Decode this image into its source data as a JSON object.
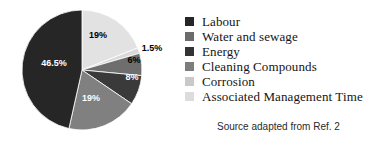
{
  "chart_data": {
    "type": "pie",
    "title": "",
    "subtitle": "",
    "xlabel": "",
    "ylabel": "",
    "grid": false,
    "legend_position": "right",
    "start_angle_deg": 0,
    "direction": "clockwise",
    "center": {
      "x": 82,
      "y": 70
    },
    "radius": 60,
    "total": 100,
    "categories": [
      "Labour",
      "Water and sewage",
      "Energy",
      "Cleaning Compounds",
      "Corrosion",
      "Associated Management Time"
    ],
    "values": [
      46.5,
      19,
      8,
      6,
      1.5,
      19
    ],
    "colors": [
      "#262626",
      "#808080",
      "#3a3a3a",
      "#6e6e6e",
      "#d9d9d9",
      "#e2e2e2"
    ],
    "slices": [
      {
        "label": "Associated Management Time",
        "value": 19,
        "display": "19%",
        "color": "#e2e2e2",
        "label_color": "#000000",
        "label_x": 98,
        "label_y": 38
      },
      {
        "label": "Corrosion",
        "value": 1.5,
        "display": "1.5%",
        "color": "#d9d9d9",
        "label_color": "#000000",
        "label_x": 152,
        "label_y": 51,
        "label_outside": true
      },
      {
        "label": "Cleaning Compounds",
        "value": 6,
        "display": "6%",
        "color": "#6e6e6e",
        "label_color": "#000000",
        "label_x": 134,
        "label_y": 63
      },
      {
        "label": "Energy",
        "value": 8,
        "display": "8%",
        "color": "#3a3a3a",
        "label_color": "#ffffff",
        "label_x": 132,
        "label_y": 80
      },
      {
        "label": "Water and sewage",
        "value": 19,
        "display": "19%",
        "color": "#808080",
        "label_color": "#ffffff",
        "label_x": 91,
        "label_y": 101
      },
      {
        "label": "Labour",
        "value": 46.5,
        "display": "46.5%",
        "color": "#262626",
        "label_color": "#ffffff",
        "label_x": 54,
        "label_y": 66
      }
    ]
  },
  "legend": {
    "items": [
      {
        "label": "Labour",
        "color": "#262626"
      },
      {
        "label": "Water and sewage",
        "color": "#6b6b6b"
      },
      {
        "label": "Energy",
        "color": "#333333"
      },
      {
        "label": "Cleaning Compounds",
        "color": "#7d7d7d"
      },
      {
        "label": "Corrosion",
        "color": "#c9c9c9"
      },
      {
        "label": "Associated Management Time",
        "color": "#dcdcdc"
      }
    ]
  },
  "source": {
    "text": "Source adapted from Ref. 2"
  }
}
